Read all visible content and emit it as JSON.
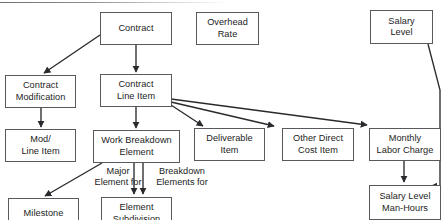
{
  "diagram": {
    "type": "flowchart",
    "stroke_color": "#58585d",
    "text_color": "#1c1c1c",
    "background_color": "#ffffff",
    "nodes": [
      {
        "id": "contract",
        "label": "Contract",
        "x": 100,
        "y": 12,
        "w": 72,
        "h": 33
      },
      {
        "id": "overhead_rate",
        "label": "Overhead\nRate",
        "x": 196,
        "y": 12,
        "w": 63,
        "h": 33
      },
      {
        "id": "salary_level",
        "label": "Salary\nLevel",
        "x": 370,
        "y": 10,
        "w": 63,
        "h": 34
      },
      {
        "id": "contract_mod",
        "label": "Contract\nModification",
        "x": 5,
        "y": 75,
        "w": 71,
        "h": 33
      },
      {
        "id": "contract_line_item",
        "label": "Contract\nLine Item",
        "x": 100,
        "y": 74,
        "w": 72,
        "h": 33
      },
      {
        "id": "mod_line_item",
        "label": "Mod/\nLine Item",
        "x": 5,
        "y": 129,
        "w": 71,
        "h": 33
      },
      {
        "id": "work_breakdown",
        "label": "Work Breakdown\nElement",
        "x": 93,
        "y": 130,
        "w": 87,
        "h": 33
      },
      {
        "id": "deliverable_item",
        "label": "Deliverable\nItem",
        "x": 194,
        "y": 128,
        "w": 71,
        "h": 33
      },
      {
        "id": "other_direct_cost",
        "label": "Other Direct\nCost Item",
        "x": 282,
        "y": 128,
        "w": 72,
        "h": 33
      },
      {
        "id": "monthly_labor",
        "label": "Monthly\nLabor Charge",
        "x": 369,
        "y": 128,
        "w": 72,
        "h": 33
      },
      {
        "id": "milestone",
        "label": "Milestone",
        "x": 8,
        "y": 198,
        "w": 71,
        "h": 32
      },
      {
        "id": "element_subdivision",
        "label": "Element\nSubdivision",
        "x": 101,
        "y": 197,
        "w": 71,
        "h": 33
      },
      {
        "id": "salary_man_hours",
        "label": "Salary Level\nMan-Hours",
        "x": 369,
        "y": 185,
        "w": 72,
        "h": 35
      }
    ],
    "edge_labels": [
      {
        "id": "major_element_for",
        "label": "Major\nElement for",
        "x": 84,
        "y": 166,
        "w": 68
      },
      {
        "id": "breakdown_elements_for",
        "label": "Breakdown\nElements for",
        "x": 146,
        "y": 166,
        "w": 72
      }
    ],
    "edges": [
      {
        "id": "contract-to-contract-modification",
        "from": "contract",
        "to": "contract_mod"
      },
      {
        "id": "contract-to-contract-line-item",
        "from": "contract",
        "to": "contract_line_item"
      },
      {
        "id": "contract-modification-to-mod-line-item",
        "from": "contract_mod",
        "to": "mod_line_item"
      },
      {
        "id": "contract-line-item-to-work-breakdown-element",
        "from": "contract_line_item",
        "to": "work_breakdown"
      },
      {
        "id": "contract-line-item-to-deliverable-item",
        "from": "contract_line_item",
        "to": "deliverable_item"
      },
      {
        "id": "contract-line-item-to-other-direct-cost-item",
        "from": "contract_line_item",
        "to": "other_direct_cost"
      },
      {
        "id": "contract-line-item-to-monthly-labor-charge",
        "from": "contract_line_item",
        "to": "monthly_labor"
      },
      {
        "id": "work-breakdown-element-to-milestone",
        "from": "work_breakdown",
        "to": "milestone",
        "label": "Major Element for"
      },
      {
        "id": "work-breakdown-element-to-element-subdivision-a",
        "from": "work_breakdown",
        "to": "element_subdivision",
        "label": "Breakdown Elements for"
      },
      {
        "id": "work-breakdown-element-to-element-subdivision-b",
        "from": "work_breakdown",
        "to": "element_subdivision",
        "label": "Breakdown Elements for"
      },
      {
        "id": "monthly-labor-charge-to-salary-level-man-hours",
        "from": "monthly_labor",
        "to": "salary_man_hours"
      },
      {
        "id": "salary-level-to-salary-level-man-hours",
        "from": "salary_level",
        "to": "salary_man_hours"
      }
    ]
  }
}
